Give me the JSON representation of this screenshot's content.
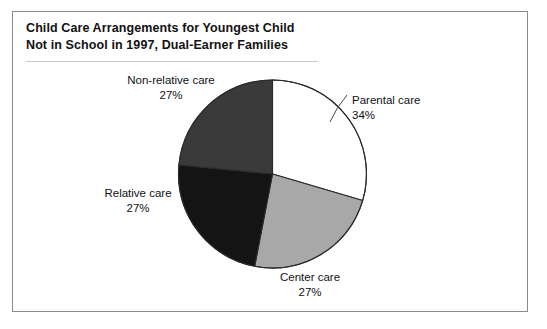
{
  "figure": {
    "title_line_1": "Child Care Arrangements for Youngest Child",
    "title_line_2": "Not in School in 1997, Dual-Earner Families"
  },
  "chart_data": {
    "type": "pie",
    "title": "Child Care Arrangements for Youngest Child Not in School in 1997, Dual-Earner Families",
    "xlabel": "",
    "ylabel": "",
    "legend_position": "none",
    "labels_position": "outside",
    "grid": false,
    "units": "percent",
    "total": 115,
    "start_angle_deg": 0,
    "direction": "clockwise",
    "categories": [
      "Parental care",
      "Center care",
      "Relative care",
      "Non-relative care"
    ],
    "values": [
      34,
      27,
      27,
      27
    ],
    "value_labels": [
      "34%",
      "27%",
      "27%",
      "27%"
    ],
    "colors": [
      "#ffffff",
      "#a8a8a8",
      "#141414",
      "#3a3a3a"
    ],
    "slices": [
      {
        "name": "Parental care",
        "value": 34,
        "value_label": "34%",
        "color": "#ffffff",
        "start_deg": 0,
        "end_deg": 122.4
      },
      {
        "name": "Center care",
        "value": 27,
        "value_label": "27%",
        "color": "#a8a8a8",
        "start_deg": 122.4,
        "end_deg": 219.6
      },
      {
        "name": "Relative care",
        "value": 27,
        "value_label": "27%",
        "color": "#141414",
        "start_deg": 219.6,
        "end_deg": 316.8
      },
      {
        "name": "Non-relative care",
        "value": 27,
        "value_label": "27%",
        "color": "#3a3a3a",
        "start_deg": 316.8,
        "end_deg": 360
      }
    ]
  },
  "labels": {
    "parental": {
      "name": "Parental care",
      "pct": "34%"
    },
    "center": {
      "name": "Center care",
      "pct": "27%"
    },
    "relative": {
      "name": "Relative care",
      "pct": "27%"
    },
    "nonrelative": {
      "name": "Non-relative care",
      "pct": "27%"
    }
  },
  "style": {
    "frame_color": "#8b8b8b",
    "rule_color": "#c9c9c9",
    "outline_color": "#2b2b2b",
    "background": "#ffffff"
  }
}
